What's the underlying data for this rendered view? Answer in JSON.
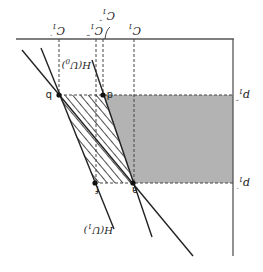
{
  "figure": {
    "orientation": "rotated 180 degrees",
    "colors": {
      "axis": "#555555",
      "line": "#222222",
      "shaded_region": "#b3b3b3",
      "hatch": "#222222",
      "dashed": "#444444",
      "background": "#ffffff"
    },
    "axis_labels": {
      "consumption_ticks": [
        {
          "id": "c1_prime",
          "base": "C",
          "sub": "1",
          "prime": "′"
        },
        {
          "id": "c1_triple",
          "base": "C",
          "sub": "1",
          "prime": "‴"
        },
        {
          "id": "c1_double",
          "base": "C",
          "sub": "1",
          "prime": "″"
        },
        {
          "id": "c1",
          "base": "C",
          "sub": "1",
          "prime": ""
        }
      ],
      "price_ticks": [
        {
          "id": "p1_double",
          "base": "p",
          "sub": "1",
          "prime": "″"
        },
        {
          "id": "p1_prime",
          "base": "p",
          "sub": "1",
          "prime": "′"
        }
      ]
    },
    "curves": [
      {
        "id": "h_u0",
        "label": "H(U",
        "sub": "0",
        "close": ")"
      },
      {
        "id": "h_u1",
        "label": "H(U",
        "sub": "1",
        "close": ")"
      }
    ],
    "points": [
      {
        "id": "a",
        "label": "a"
      },
      {
        "id": "b",
        "label": "b"
      },
      {
        "id": "d",
        "label": "d"
      },
      {
        "id": "f",
        "label": "f"
      }
    ],
    "regions": [
      {
        "id": "shaded",
        "description": "gray rectangle between p1′ and p1″ right of H(U0)"
      },
      {
        "id": "hatched",
        "description": "hatched area b-d-a-f between H(U0) and H(U1)"
      }
    ]
  }
}
